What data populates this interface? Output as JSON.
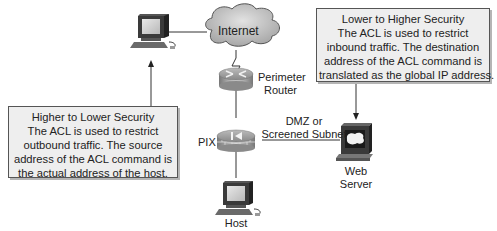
{
  "diagram": {
    "nodes": {
      "internet": {
        "label": "Internet",
        "icon": "cloud-icon"
      },
      "perimeter_router": {
        "label_line1": "Perimeter",
        "label_line2": "Router",
        "icon": "router-icon"
      },
      "pix": {
        "label": "PIX",
        "icon": "firewall-icon"
      },
      "dmz": {
        "label_line1": "DMZ or",
        "label_line2": "Screened Subnet"
      },
      "web_server": {
        "label_line1": "Web",
        "label_line2": "Server",
        "icon": "server-icon"
      },
      "host": {
        "label": "Host",
        "icon": "workstation-icon"
      },
      "outside_pc": {
        "icon": "workstation-icon"
      }
    },
    "callouts": {
      "outbound": {
        "lines": [
          "Higher to Lower Security",
          "The ACL is used to restrict",
          "outbound traffic. The source",
          "address of the ACL command is",
          "the actual address of the host."
        ]
      },
      "inbound": {
        "lines": [
          "Lower to Higher Security",
          "The ACL is used to restrict",
          "inbound traffic. The destination",
          "address of the ACL command is",
          "translated as the global IP address."
        ]
      }
    },
    "colors": {
      "callout_bg": "#eeeeee",
      "cloud": "#c8c8c8",
      "device_dark": "#3a3a3a",
      "line": "#333333"
    }
  }
}
